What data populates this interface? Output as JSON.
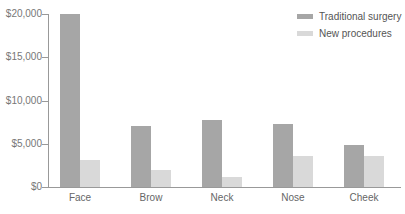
{
  "chart_data": {
    "type": "bar",
    "title": "",
    "xlabel": "",
    "ylabel": "",
    "categories": [
      "Face",
      "Brow",
      "Neck",
      "Nose",
      "Cheek"
    ],
    "series": [
      {
        "name": "Traditional surgery",
        "color": "#a6a6a6",
        "values": [
          20000,
          7000,
          7800,
          7300,
          4900
        ]
      },
      {
        "name": "New procedures",
        "color": "#d9d9d9",
        "values": [
          3100,
          2000,
          1200,
          3600,
          3600
        ]
      }
    ],
    "ylim": [
      0,
      20000
    ],
    "yticks": [
      0,
      5000,
      10000,
      15000,
      20000
    ],
    "ytick_labels": [
      "$0",
      "$5,000",
      "$10,000",
      "$15,000",
      "$20,000"
    ],
    "grid": false,
    "legend_position": "top-right"
  },
  "legend": {
    "items": [
      {
        "label": "Traditional surgery"
      },
      {
        "label": "New procedures"
      }
    ]
  }
}
